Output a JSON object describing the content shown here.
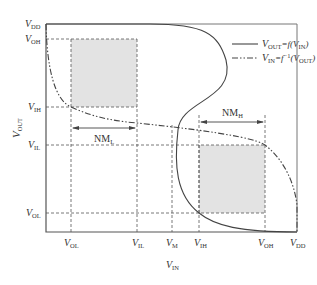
{
  "diagram": {
    "y_axis": {
      "label_main": "V",
      "label_sub": "OUT"
    },
    "x_axis": {
      "label_main": "V",
      "label_sub": "IN"
    },
    "y_ticks": [
      {
        "main": "V",
        "sub": "DD"
      },
      {
        "main": "V",
        "sub": "OH"
      },
      {
        "main": "V",
        "sub": "IH"
      },
      {
        "main": "V",
        "sub": "IL"
      },
      {
        "main": "V",
        "sub": "OL"
      }
    ],
    "x_ticks": [
      {
        "main": "V",
        "sub": "OL"
      },
      {
        "main": "V",
        "sub": "IL"
      },
      {
        "main": "V",
        "sub": "M"
      },
      {
        "main": "V",
        "sub": "IH"
      },
      {
        "main": "V",
        "sub": "OH"
      },
      {
        "main": "V",
        "sub": "DD"
      }
    ],
    "legend": [
      {
        "style": "solid",
        "text_parts": [
          "V",
          "OUT",
          "=f(V",
          "IN",
          ")"
        ]
      },
      {
        "style": "dash-dot",
        "text_parts": [
          "V",
          "IN",
          "=f",
          "−1",
          "(V",
          "OUT",
          ")"
        ]
      }
    ],
    "noise_margins": {
      "low": {
        "main": "NM",
        "sub": "L"
      },
      "high": {
        "main": "NM",
        "sub": "H"
      }
    },
    "colors": {
      "shade": "#e3e3e3",
      "line": "#444444",
      "frame": "#777777"
    }
  }
}
